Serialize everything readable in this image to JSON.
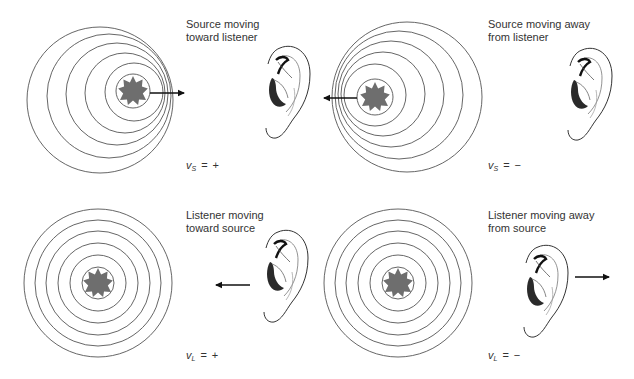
{
  "figure": {
    "topic": "Doppler effect",
    "colors": {
      "background": "#ffffff",
      "wavefront": "#555555",
      "source_fill": "#6e6e6e",
      "arrow": "#111111",
      "text": "#333333"
    },
    "panels": [
      {
        "id": "source-toward",
        "caption": "Source moving\ntoward listener",
        "velocity": {
          "symbol": "v",
          "subscript": "S",
          "equals": "=",
          "sign": "+"
        },
        "moving_object": "source",
        "arrow_direction": "right",
        "wavefront_count": 6
      },
      {
        "id": "source-away",
        "caption": "Source moving away\nfrom listener",
        "velocity": {
          "symbol": "v",
          "subscript": "S",
          "equals": "=",
          "sign": "−"
        },
        "moving_object": "source",
        "arrow_direction": "left",
        "wavefront_count": 6
      },
      {
        "id": "listener-toward",
        "caption": "Listener moving\ntoward source",
        "velocity": {
          "symbol": "v",
          "subscript": "L",
          "equals": "=",
          "sign": "+"
        },
        "moving_object": "listener",
        "arrow_direction": "left",
        "wavefront_count": 6
      },
      {
        "id": "listener-away",
        "caption": "Listener moving away\nfrom source",
        "velocity": {
          "symbol": "v",
          "subscript": "L",
          "equals": "=",
          "sign": "−"
        },
        "moving_object": "listener",
        "arrow_direction": "right",
        "wavefront_count": 6
      }
    ]
  }
}
